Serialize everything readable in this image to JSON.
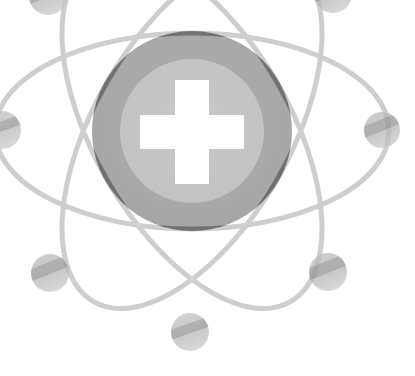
{
  "canvas": {
    "width": 415,
    "height": 376,
    "background": "#ffffff",
    "title": "Atom with medical cross watermark",
    "style": "grayscale-watermark"
  },
  "palette": {
    "background": "#ffffff",
    "nucleus_outer": "#a8a8a8",
    "nucleus_inner": "#c4c4c4",
    "cross_fill": "#ffffff",
    "orbit_stroke": "#d8d8d8",
    "orbit_stroke_dark": "#bdbdbd",
    "electron_light": "#cfcfcf",
    "electron_mid": "#bcbcbc",
    "electron_dark": "#a9a9a9"
  },
  "nucleus": {
    "label": "nucleus",
    "center_x": 192,
    "center_y": 131,
    "outer_radius": 100,
    "inner_radius": 72,
    "outer_color": "#a8a8a8",
    "inner_color": "#c4c4c4"
  },
  "cross": {
    "label": "medical cross",
    "center_x": 192,
    "center_y": 132,
    "arm_thickness": 34,
    "arm_length": 104,
    "color": "#ffffff"
  },
  "orbits": [
    {
      "name": "orbit-horizontal",
      "rx": 197,
      "ry": 98,
      "rotation_deg": 0,
      "stroke": "#d8d8d8",
      "stroke_width": 5
    },
    {
      "name": "orbit-tilted-right",
      "rx": 197,
      "ry": 98,
      "rotation_deg": 60,
      "stroke": "#d8d8d8",
      "stroke_width": 5
    },
    {
      "name": "orbit-tilted-left",
      "rx": 197,
      "ry": 98,
      "rotation_deg": -60,
      "stroke": "#d8d8d8",
      "stroke_width": 5
    }
  ],
  "electrons": [
    {
      "name": "electron-left",
      "cx": 2,
      "cy": 130,
      "r": 19
    },
    {
      "name": "electron-right",
      "cx": 382,
      "cy": 130,
      "r": 18
    },
    {
      "name": "electron-bottom-left",
      "cx": 50,
      "cy": 273,
      "r": 19
    },
    {
      "name": "electron-bottom-right",
      "cx": 328,
      "cy": 272,
      "r": 19
    },
    {
      "name": "electron-bottom",
      "cx": 190,
      "cy": 332,
      "r": 19
    },
    {
      "name": "electron-top-left",
      "cx": 48,
      "cy": -4,
      "r": 19
    },
    {
      "name": "electron-top-right",
      "cx": 333,
      "cy": -6,
      "r": 19
    }
  ]
}
